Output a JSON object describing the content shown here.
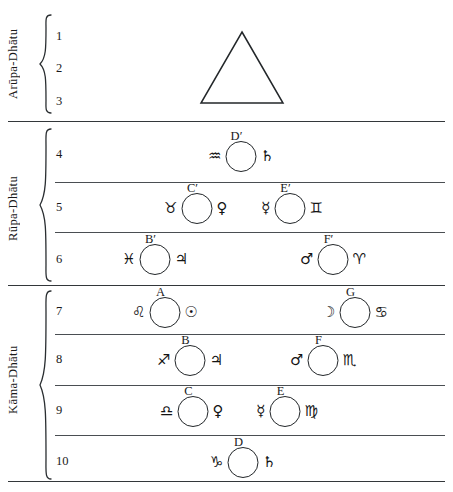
{
  "diagram": {
    "background_color": "#ffffff",
    "line_color": "#33373a"
  },
  "groups": [
    {
      "id": "arupa",
      "label": "Arūpa-Dhātu"
    },
    {
      "id": "rupa",
      "label": "Rūpa-Dhātu"
    },
    {
      "id": "kama",
      "label": "Kāma-Dhātu"
    }
  ],
  "rows": [
    {
      "number": "1"
    },
    {
      "number": "2"
    },
    {
      "number": "3"
    },
    {
      "number": "4"
    },
    {
      "number": "5"
    },
    {
      "number": "6"
    },
    {
      "number": "7"
    },
    {
      "number": "8"
    },
    {
      "number": "9"
    },
    {
      "number": "10"
    }
  ],
  "shapes": {
    "triangle": {
      "name": "triangle-outline",
      "row": "1-3"
    }
  },
  "units": [
    {
      "id": "Dprime",
      "label": "D′",
      "row": "4",
      "left_glyph": "♒",
      "left_glyph_name": "aquarius-sign",
      "right_glyph": "♄",
      "right_glyph_name": "saturn-symbol"
    },
    {
      "id": "Cprime",
      "label": "C′",
      "row": "5",
      "left_glyph": "♉",
      "left_glyph_name": "taurus-sign",
      "right_glyph": "♀",
      "right_glyph_name": "venus-symbol"
    },
    {
      "id": "Eprime",
      "label": "E′",
      "row": "5",
      "left_glyph": "☿",
      "left_glyph_name": "mercury-symbol",
      "right_glyph": "♊",
      "right_glyph_name": "gemini-sign"
    },
    {
      "id": "Bprime",
      "label": "B′",
      "row": "6",
      "left_glyph": "♓",
      "left_glyph_name": "pisces-sign",
      "right_glyph": "♃",
      "right_glyph_name": "jupiter-symbol"
    },
    {
      "id": "Fprime",
      "label": "F′",
      "row": "6",
      "left_glyph": "♂",
      "left_glyph_name": "mars-symbol",
      "right_glyph": "♈",
      "right_glyph_name": "aries-sign"
    },
    {
      "id": "A",
      "label": "A",
      "row": "7",
      "left_glyph": "♌",
      "left_glyph_name": "leo-sign",
      "right_glyph": "☉",
      "right_glyph_name": "sun-symbol"
    },
    {
      "id": "G",
      "label": "G",
      "row": "7",
      "left_glyph": "☽",
      "left_glyph_name": "moon-symbol",
      "right_glyph": "♋",
      "right_glyph_name": "cancer-sign"
    },
    {
      "id": "B",
      "label": "B",
      "row": "8",
      "left_glyph": "♐",
      "left_glyph_name": "sagittarius-sign",
      "right_glyph": "♃",
      "right_glyph_name": "jupiter-symbol"
    },
    {
      "id": "F",
      "label": "F",
      "row": "8",
      "left_glyph": "♂",
      "left_glyph_name": "mars-symbol",
      "right_glyph": "♏",
      "right_glyph_name": "scorpio-sign"
    },
    {
      "id": "C",
      "label": "C",
      "row": "9",
      "left_glyph": "♎",
      "left_glyph_name": "libra-sign",
      "right_glyph": "♀",
      "right_glyph_name": "venus-symbol"
    },
    {
      "id": "E",
      "label": "E",
      "row": "9",
      "left_glyph": "☿",
      "left_glyph_name": "mercury-symbol",
      "right_glyph": "♍",
      "right_glyph_name": "virgo-sign"
    },
    {
      "id": "D",
      "label": "D",
      "row": "10",
      "left_glyph": "♑",
      "left_glyph_name": "capricorn-sign",
      "right_glyph": "♄",
      "right_glyph_name": "saturn-symbol"
    }
  ]
}
